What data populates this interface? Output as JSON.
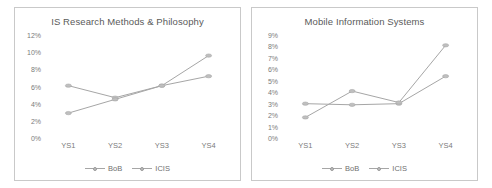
{
  "figure": {
    "background_color": "#ffffff",
    "panel_border_color": "#c9c9c9",
    "series_color": "#a6a6a6",
    "marker_color": "#bfbfbf",
    "text_color": "#7b7b7b"
  },
  "legend": {
    "entries": [
      {
        "label": "BoB",
        "color": "#a6a6a6"
      },
      {
        "label": "ICIS",
        "color": "#a6a6a6"
      }
    ]
  },
  "chart_data": [
    {
      "type": "line",
      "title": "IS Research Methods & Philosophy",
      "xlabel": "",
      "ylabel": "",
      "categories": [
        "YS1",
        "YS2",
        "YS3",
        "YS4"
      ],
      "ylim": [
        0,
        12
      ],
      "yticks": [
        0,
        2,
        4,
        6,
        8,
        10,
        12
      ],
      "ytick_labels": [
        "0%",
        "2%",
        "4%",
        "6%",
        "8%",
        "10%",
        "12%"
      ],
      "grid": false,
      "legend_position": "bottom",
      "series": [
        {
          "name": "BoB",
          "values": [
            6.1,
            4.7,
            6.1,
            7.2
          ]
        },
        {
          "name": "ICIS",
          "values": [
            2.9,
            4.5,
            6.1,
            9.6
          ]
        }
      ]
    },
    {
      "type": "line",
      "title": "Mobile Information Systems",
      "xlabel": "",
      "ylabel": "",
      "categories": [
        "YS1",
        "YS2",
        "YS3",
        "YS4"
      ],
      "ylim": [
        0,
        9
      ],
      "yticks": [
        0,
        1,
        2,
        3,
        4,
        5,
        6,
        7,
        8,
        9
      ],
      "ytick_labels": [
        "0%",
        "1%",
        "2%",
        "3%",
        "4%",
        "5%",
        "6%",
        "7%",
        "8%",
        "9%"
      ],
      "grid": false,
      "legend_position": "bottom",
      "series": [
        {
          "name": "BoB",
          "values": [
            3.0,
            2.9,
            3.0,
            5.4
          ]
        },
        {
          "name": "ICIS",
          "values": [
            1.8,
            4.1,
            3.1,
            8.1
          ]
        }
      ]
    }
  ]
}
